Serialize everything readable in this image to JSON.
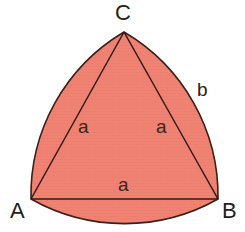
{
  "figure": {
    "kind": "reuleaux-triangle-diagram",
    "background_color": "#ffffff",
    "fill_color": "#f08273",
    "stroke_color": "#3a2018",
    "stroke_width": 1.6,
    "texture_color": "#e8705f",
    "width": 245,
    "height": 232
  },
  "vertices": {
    "a": {
      "label": "A",
      "x": 31,
      "y": 199,
      "label_x": 10,
      "label_y": 200
    },
    "b": {
      "label": "B",
      "x": 218,
      "y": 199,
      "label_x": 222,
      "label_y": 200
    },
    "c": {
      "label": "C",
      "x": 124,
      "y": 32,
      "label_x": 115,
      "label_y": 2
    }
  },
  "side_labels": [
    {
      "name": "side-ac",
      "text": "a",
      "x": 78,
      "y": 117
    },
    {
      "name": "side-bc",
      "text": "a",
      "x": 156,
      "y": 117
    },
    {
      "name": "side-ab",
      "text": "a",
      "x": 118,
      "y": 175
    }
  ],
  "arc_labels": [
    {
      "name": "arc-b",
      "text": "b",
      "x": 197,
      "y": 80
    }
  ],
  "geometry": {
    "arc_ab_sagitta": 30,
    "arc_bc_sagitta": 30,
    "arc_ca_sagitta": 30,
    "triangle_side_px": 187
  }
}
